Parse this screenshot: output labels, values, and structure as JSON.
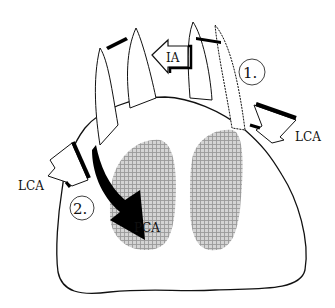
{
  "diagram": {
    "type": "anatomical-illustration",
    "labels": {
      "ia": "IA",
      "lca_right": "LCA",
      "lca_left": "LCA",
      "pca": "PCA",
      "marker_1": "1.",
      "marker_2": "2."
    },
    "regions": [
      {
        "name": "left-shaded-region",
        "pattern": "crosshatch",
        "color": "#b8b8b8"
      },
      {
        "name": "right-shaded-region",
        "pattern": "crosshatch",
        "color": "#b8b8b8"
      }
    ],
    "arrows": [
      {
        "name": "ia-arrow",
        "label": "IA",
        "style": "hollow",
        "direction": "left"
      },
      {
        "name": "lca-right-arrow",
        "label": "LCA",
        "style": "hollow-zigzag",
        "direction": "down-left"
      },
      {
        "name": "lca-left-arrow",
        "label": "LCA",
        "style": "hollow-zigzag",
        "direction": "down-left"
      },
      {
        "name": "pca-arrow",
        "label": "PCA",
        "style": "solid-black-curved",
        "direction": "down-right"
      },
      {
        "name": "small-arrow-left-tip",
        "style": "solid-small",
        "direction": "left"
      },
      {
        "name": "small-arrow-right-tip",
        "style": "solid-small",
        "direction": "left"
      }
    ],
    "colors": {
      "stroke": "#111111",
      "fill": "#ffffff",
      "shade": "#bdbdbd",
      "arrow_solid": "#000000"
    }
  }
}
